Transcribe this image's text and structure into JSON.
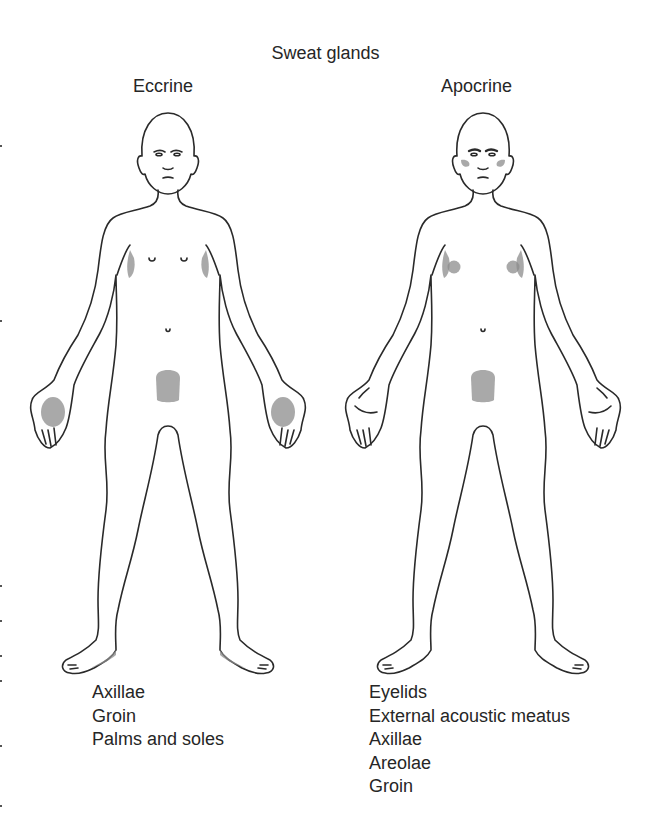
{
  "title": "Sweat glands",
  "columns": [
    {
      "id": "eccrine",
      "heading": "Eccrine",
      "shaded_regions": [
        "axillae",
        "groin",
        "palms",
        "soles"
      ],
      "labels": [
        "Axillae",
        "Groin",
        "Palms and soles"
      ]
    },
    {
      "id": "apocrine",
      "heading": "Apocrine",
      "shaded_regions": [
        "eyelids",
        "external-acoustic-meatus",
        "axillae",
        "areolae",
        "groin"
      ],
      "labels": [
        "Eyelids",
        "External acoustic meatus",
        "Axillae",
        "Areolae",
        "Groin"
      ]
    }
  ],
  "colors": {
    "outline": "#2a2a2a",
    "shading": "#8c8c8c",
    "text": "#262626",
    "background": "#ffffff"
  }
}
